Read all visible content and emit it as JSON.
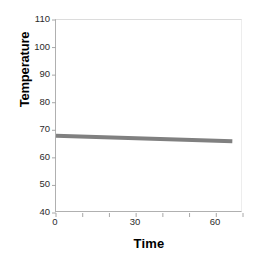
{
  "chart_data": {
    "type": "line",
    "title": "",
    "xlabel": "Time",
    "ylabel": "Temperature",
    "xlim": [
      0,
      70
    ],
    "ylim": [
      40,
      110
    ],
    "grid": false,
    "legend": null,
    "x_tick_values": [
      0,
      10,
      20,
      30,
      40,
      50,
      60,
      70
    ],
    "x_tick_labels": [
      "0",
      "",
      "",
      "30",
      "",
      "",
      "60",
      ""
    ],
    "x_labeled_ticks": [
      {
        "value": 0,
        "label": "0"
      },
      {
        "value": 30,
        "label": "30"
      },
      {
        "value": 60,
        "label": "60"
      }
    ],
    "y_tick_values": [
      40,
      50,
      60,
      70,
      80,
      90,
      100,
      110
    ],
    "y_tick_labels": [
      "40",
      "50",
      "60",
      "70",
      "80",
      "90",
      "100",
      "110"
    ],
    "series": [
      {
        "name": "Temperature",
        "color": "#808080",
        "line_width": 4,
        "x": [
          0,
          66
        ],
        "values": [
          68,
          66
        ]
      }
    ]
  },
  "axes": {
    "line_color": "#b0b0b0",
    "tick_color": "#a8a8a8",
    "tick_label_color": "#2b2b2b",
    "axis_title_color": "#000000"
  }
}
